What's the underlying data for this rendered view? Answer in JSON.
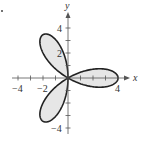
{
  "chart_data": {
    "type": "line",
    "subtype": "polar-rose",
    "equation": "r = 4cos(3θ)",
    "petals": 3,
    "amplitude": 4,
    "petal_tips": [
      {
        "angle_deg": 0,
        "x": 4,
        "y": 0
      },
      {
        "angle_deg": 120,
        "x": -2,
        "y": 3.46
      },
      {
        "angle_deg": 240,
        "x": -2,
        "y": -3.46
      }
    ],
    "title": "",
    "xlabel": "x",
    "ylabel": "y",
    "xlim": [
      -4.6,
      4.8
    ],
    "ylim": [
      -4.6,
      4.8
    ],
    "x_tick_labels": [
      "-4",
      "-2",
      "4"
    ],
    "y_tick_labels": [
      "4",
      "2",
      "-4"
    ],
    "x_ticks": [
      -4,
      -3,
      -2,
      -1,
      1,
      2,
      3,
      4
    ],
    "y_ticks": [
      -4,
      -3,
      -2,
      -1,
      1,
      2,
      3,
      4
    ],
    "grid": false,
    "fill": "#e6e6e6",
    "stroke": "#222222"
  },
  "labels": {
    "x_axis": "x",
    "y_axis": "y",
    "x_neg4": "−4",
    "x_neg2": "−2",
    "x_pos4": "4",
    "y_pos4": "4",
    "y_pos2": "2",
    "y_neg4": "−4"
  }
}
